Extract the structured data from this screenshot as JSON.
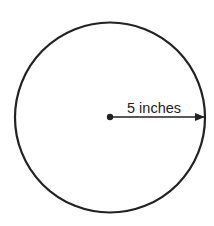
{
  "diagram": {
    "shape": "circle",
    "radius_label": "5 inches",
    "stroke_color": "#222222",
    "background": "#ffffff"
  }
}
